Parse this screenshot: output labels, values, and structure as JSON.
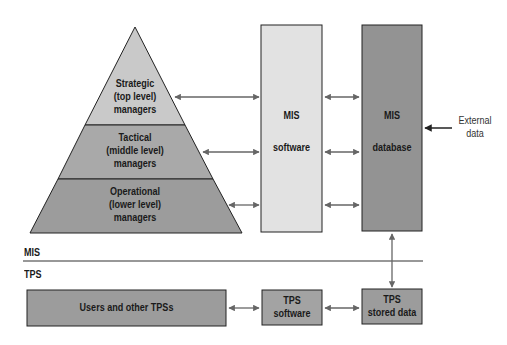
{
  "diagram": {
    "pyramid": {
      "levels": [
        {
          "line1": "Strategic",
          "line2": "(top level)",
          "line3": "managers"
        },
        {
          "line1": "Tactical",
          "line2": "(middle level)",
          "line3": "managers"
        },
        {
          "line1": "Operational",
          "line2": "(lower level)",
          "line3": "managers"
        }
      ]
    },
    "mis_software": {
      "line1": "MIS",
      "line2": "software"
    },
    "mis_database": {
      "line1": "MIS",
      "line2": "database"
    },
    "external_data": {
      "line1": "External",
      "line2": "data"
    },
    "section_labels": {
      "upper": "MIS",
      "lower": "TPS"
    },
    "tps": {
      "users": "Users and other TPSs",
      "software": {
        "line1": "TPS",
        "line2": "software"
      },
      "stored_data": {
        "line1": "TPS",
        "line2": "stored data"
      }
    },
    "colors": {
      "light_fill": "#c9c9c9",
      "mid_fill": "#a9a9a9",
      "dark_fill": "#999999",
      "software_fill": "#e2e2e2",
      "database_fill": "#939393",
      "arrow": "#666666",
      "stroke": "#222222"
    }
  }
}
